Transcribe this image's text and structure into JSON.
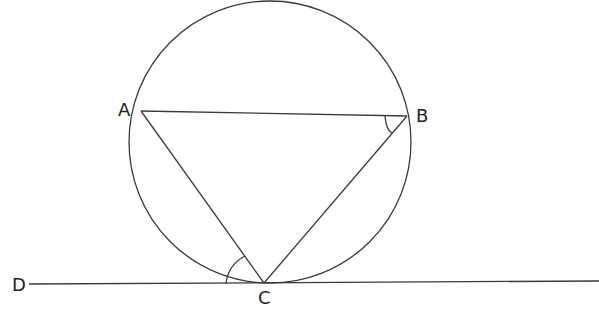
{
  "figure": {
    "type": "geometry",
    "points": {
      "A": {
        "label": "A",
        "x": 141,
        "y": 111
      },
      "B": {
        "label": "B",
        "x": 407,
        "y": 116
      },
      "C": {
        "label": "C",
        "x": 264,
        "y": 283
      },
      "D": {
        "label": "D",
        "x": 29,
        "y": 284
      }
    },
    "circle": {
      "cx": 270,
      "cy": 142,
      "r": 141
    },
    "tangent_line": {
      "from": "D",
      "to_x": 599,
      "to_y": 281
    },
    "marked_angles": [
      "angle ABC",
      "angle DCA"
    ],
    "stroke_color": "#3a3a3a"
  }
}
